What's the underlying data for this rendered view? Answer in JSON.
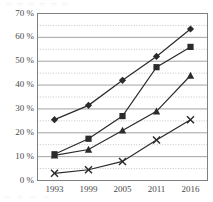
{
  "chart_data": {
    "type": "line",
    "title": "",
    "subtitle": "",
    "xlabel": "",
    "ylabel": "",
    "categories": [
      "1993",
      "1999",
      "2005",
      "2011",
      "2016"
    ],
    "x_tick_labels": [
      "1993",
      "1999",
      "2005",
      "2011",
      "2016"
    ],
    "y_tick_labels": [
      "0 %",
      "10 %",
      "20 %",
      "30 %",
      "40 %",
      "50 %",
      "60 %",
      "70 %"
    ],
    "y_tick_values": [
      0,
      10,
      20,
      30,
      40,
      50,
      60,
      70
    ],
    "ylim": [
      0,
      70
    ],
    "y_major_step": 10,
    "y_minor_step": 5,
    "grid": "horizontal-major-solid-and-minor-dotted",
    "legend": "none",
    "legend_position": "none",
    "series": [
      {
        "name": "series-1",
        "marker": "diamond",
        "color": "#2b2b2b",
        "values": [
          25.5,
          31.5,
          42,
          52,
          63.5
        ]
      },
      {
        "name": "series-2",
        "marker": "square",
        "color": "#2b2b2b",
        "values": [
          11,
          17.5,
          27,
          47.5,
          56
        ]
      },
      {
        "name": "series-3",
        "marker": "triangle",
        "color": "#2b2b2b",
        "values": [
          10.5,
          13,
          21,
          29,
          44
        ]
      },
      {
        "name": "series-4",
        "marker": "cross",
        "color": "#2b2b2b",
        "values": [
          3,
          4.5,
          8,
          17,
          25.5
        ]
      }
    ]
  },
  "axes": {
    "frame_color": "#808080",
    "major_gridline_color": "#9a9a9a",
    "minor_gridline_color": "#b5b5b5"
  },
  "cropped_edges": {
    "top_strip_text": "▭  ▭  ▭  ▭  ▭  ▭",
    "bottom_strip_text": "▭     ▭     ▭     ▭"
  }
}
